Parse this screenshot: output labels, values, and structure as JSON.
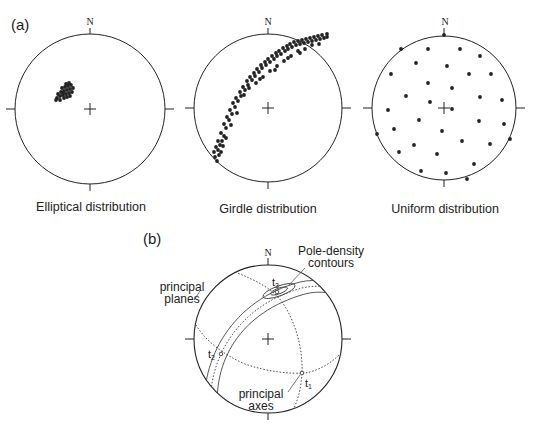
{
  "panel_a": {
    "label": "(a)",
    "north_label": "N",
    "nets": [
      {
        "caption": "Elliptical distribution",
        "cx": 90,
        "cy": 109,
        "r": 75,
        "points": [
          [
            57,
            98
          ],
          [
            60,
            96
          ],
          [
            63,
            95
          ],
          [
            66,
            94
          ],
          [
            69,
            93
          ],
          [
            72,
            92
          ],
          [
            58,
            94
          ],
          [
            61,
            92
          ],
          [
            64,
            91
          ],
          [
            67,
            90
          ],
          [
            70,
            89
          ],
          [
            73,
            88
          ],
          [
            62,
            88
          ],
          [
            65,
            87
          ],
          [
            68,
            86
          ],
          [
            71,
            85
          ],
          [
            56,
            100
          ],
          [
            60,
            100
          ],
          [
            64,
            98
          ],
          [
            67,
            97
          ],
          [
            70,
            96
          ],
          [
            66,
            84
          ],
          [
            69,
            83
          ],
          [
            63,
            93
          ]
        ]
      },
      {
        "caption": "Girdle distribution",
        "cx": 268,
        "cy": 108,
        "r": 74,
        "points": [
          [
            217,
            161
          ],
          [
            215,
            157
          ],
          [
            219,
            155
          ],
          [
            214,
            152
          ],
          [
            218,
            150
          ],
          [
            221,
            152
          ],
          [
            216,
            147
          ],
          [
            220,
            145
          ],
          [
            222,
            141
          ],
          [
            218,
            141
          ],
          [
            224,
            136
          ],
          [
            221,
            133
          ],
          [
            226,
            128
          ],
          [
            224,
            124
          ],
          [
            229,
            120
          ],
          [
            227,
            117
          ],
          [
            232,
            114
          ],
          [
            230,
            110
          ],
          [
            235,
            107
          ],
          [
            233,
            103
          ],
          [
            238,
            101
          ],
          [
            236,
            98
          ],
          [
            241,
            96
          ],
          [
            240,
            92
          ],
          [
            245,
            90
          ],
          [
            243,
            87
          ],
          [
            248,
            85
          ],
          [
            247,
            81
          ],
          [
            252,
            80
          ],
          [
            250,
            77
          ],
          [
            255,
            76
          ],
          [
            254,
            73
          ],
          [
            259,
            72
          ],
          [
            257,
            69
          ],
          [
            262,
            68
          ],
          [
            261,
            65
          ],
          [
            266,
            65
          ],
          [
            265,
            62
          ],
          [
            270,
            62
          ],
          [
            268,
            59
          ],
          [
            274,
            59
          ],
          [
            272,
            56
          ],
          [
            277,
            56
          ],
          [
            276,
            53
          ],
          [
            281,
            54
          ],
          [
            279,
            51
          ],
          [
            285,
            51
          ],
          [
            283,
            48
          ],
          [
            288,
            49
          ],
          [
            287,
            46
          ],
          [
            292,
            47
          ],
          [
            290,
            44
          ],
          [
            296,
            45
          ],
          [
            294,
            42
          ],
          [
            300,
            44
          ],
          [
            298,
            41
          ],
          [
            304,
            43
          ],
          [
            302,
            40
          ],
          [
            308,
            42
          ],
          [
            306,
            39
          ],
          [
            312,
            41
          ],
          [
            310,
            38
          ],
          [
            316,
            40
          ],
          [
            314,
            37
          ],
          [
            320,
            39
          ],
          [
            318,
            36
          ],
          [
            324,
            38
          ],
          [
            322,
            35
          ],
          [
            327,
            37
          ],
          [
            327,
            34
          ],
          [
            244,
            95
          ],
          [
            249,
            88
          ],
          [
            256,
            83
          ],
          [
            263,
            77
          ],
          [
            270,
            71
          ],
          [
            277,
            66
          ],
          [
            284,
            61
          ],
          [
            291,
            56
          ],
          [
            298,
            51
          ],
          [
            305,
            49
          ],
          [
            312,
            45
          ],
          [
            319,
            44
          ],
          [
            223,
            146
          ],
          [
            226,
            138
          ],
          [
            231,
            125
          ],
          [
            237,
            113
          ],
          [
            260,
            79
          ],
          [
            275,
            70
          ],
          [
            288,
            58
          ],
          [
            300,
            53
          ]
        ]
      },
      {
        "caption": "Uniform distribution",
        "cx": 444,
        "cy": 108,
        "r": 72,
        "points": [
          [
            444,
            35
          ],
          [
            401,
            49
          ],
          [
            428,
            49
          ],
          [
            460,
            49
          ],
          [
            480,
            56
          ],
          [
            416,
            63
          ],
          [
            447,
            66
          ],
          [
            391,
            74
          ],
          [
            469,
            74
          ],
          [
            491,
            74
          ],
          [
            428,
            83
          ],
          [
            452,
            88
          ],
          [
            406,
            96
          ],
          [
            480,
            97
          ],
          [
            502,
            100
          ],
          [
            430,
            102
          ],
          [
            452,
            109
          ],
          [
            388,
            110
          ],
          [
            419,
            120
          ],
          [
            479,
            121
          ],
          [
            504,
            124
          ],
          [
            394,
            129
          ],
          [
            442,
            131
          ],
          [
            377,
            134
          ],
          [
            462,
            141
          ],
          [
            510,
            139
          ],
          [
            414,
            145
          ],
          [
            490,
            144
          ],
          [
            399,
            152
          ],
          [
            437,
            154
          ],
          [
            474,
            164
          ],
          [
            421,
            171
          ],
          [
            446,
            173
          ],
          [
            467,
            179
          ]
        ]
      }
    ]
  },
  "panel_b": {
    "label": "(b)",
    "north_label": "N",
    "cx": 268,
    "cy": 339,
    "r": 74,
    "annotations": {
      "pole_density_line1": "Pole-density",
      "pole_density_line2": "contours",
      "principal_planes_line1": "principal",
      "principal_planes_line2": "planes",
      "principal_axes_line1": "principal",
      "principal_axes_line2": "axes"
    },
    "axes": [
      {
        "name": "t3",
        "main": "t",
        "sub": "3",
        "x": 277,
        "y": 292
      },
      {
        "name": "t2",
        "main": "t",
        "sub": "2",
        "x": 221,
        "y": 354
      },
      {
        "name": "t1",
        "main": "t",
        "sub": "1",
        "x": 302,
        "y": 373
      }
    ]
  },
  "colors": {
    "ink": "#222222",
    "background": "#ffffff"
  }
}
